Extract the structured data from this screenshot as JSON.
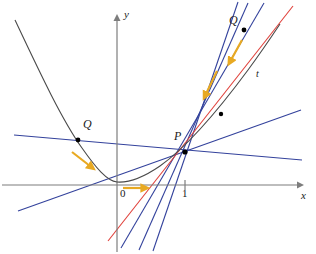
{
  "figure": {
    "background": "#ffffff",
    "width": 316,
    "height": 254
  },
  "colors": {
    "curve": "#4a4a4a",
    "axis": "#7d7d7d",
    "secant": "#33429c",
    "tangent": "#e0403a",
    "arrow": "#e8a922",
    "point": "#000000",
    "text": "#1a1a1a"
  },
  "axes": {
    "x_label": "x",
    "y_label": "y",
    "origin_label": "0",
    "origin_px": {
      "x": 117,
      "y": 185
    },
    "x_axis_y_px": 185,
    "y_axis_x_px": 117,
    "x_arrow_tip_px": {
      "x": 303,
      "y": 185
    },
    "y_arrow_tip_px": {
      "x": 117,
      "y": 14
    },
    "ticks": [
      {
        "label": "1",
        "x_px": 185,
        "y_px": 185
      }
    ]
  },
  "curve": {
    "name": "parabola",
    "stroke": "#4a4a4a",
    "path": "M 15,20 C 40,73 62,120 82,148 C 96,168 107,181 117,182 C 130,183 144,177 160,166 C 184,149 214,116 248,70 C 262,51 272,36 280,24"
  },
  "points": [
    {
      "name": "P",
      "label": "P",
      "x_px": 185,
      "y_px": 152,
      "label_x_px": 174,
      "label_y_px": 134
    },
    {
      "name": "Q-left",
      "label": "Q",
      "x_px": 78,
      "y_px": 140,
      "label_x_px": 83,
      "label_y_px": 122
    },
    {
      "name": "Q-right",
      "label": "Q",
      "x_px": 244,
      "y_px": 30,
      "label_x_px": 229,
      "label_y_px": 18
    },
    {
      "name": "Q-mid-right",
      "label": "",
      "x_px": 221,
      "y_px": 114,
      "label_x_px": 0,
      "label_y_px": 0
    }
  ],
  "tangent": {
    "name": "tangent-line-t",
    "label": "t",
    "label_x_px": 257,
    "label_y_px": 73,
    "stroke": "#e0403a",
    "x1": 108,
    "y1": 241,
    "x2": 293,
    "y2": 6
  },
  "secants": [
    {
      "name": "secant-steep-1",
      "stroke": "#33429c",
      "x1": 121,
      "y1": 248,
      "x2": 264,
      "y2": 3
    },
    {
      "name": "secant-steep-2",
      "stroke": "#33429c",
      "x1": 139,
      "y1": 250,
      "x2": 248,
      "y2": 3
    },
    {
      "name": "secant-steep-3",
      "stroke": "#33429c",
      "x1": 153,
      "y1": 251,
      "x2": 238,
      "y2": 2
    },
    {
      "name": "secant-shallow-up",
      "stroke": "#33429c",
      "x1": 18,
      "y1": 211,
      "x2": 301,
      "y2": 110
    },
    {
      "name": "secant-shallow-down",
      "stroke": "#33429c",
      "x1": 14,
      "y1": 135,
      "x2": 302,
      "y2": 160
    }
  ],
  "arrows": [
    {
      "name": "arrow-q-left-to-p",
      "x1": 73,
      "y1": 153,
      "x2": 92,
      "y2": 167
    },
    {
      "name": "arrow-q-right-to-p",
      "x1": 241,
      "y1": 41,
      "x2": 230,
      "y2": 61
    },
    {
      "name": "arrow-secant-slide",
      "x1": 216,
      "y1": 72,
      "x2": 205,
      "y2": 95
    },
    {
      "name": "arrow-origin-right",
      "x1": 124,
      "y1": 188,
      "x2": 144,
      "y2": 188
    }
  ]
}
